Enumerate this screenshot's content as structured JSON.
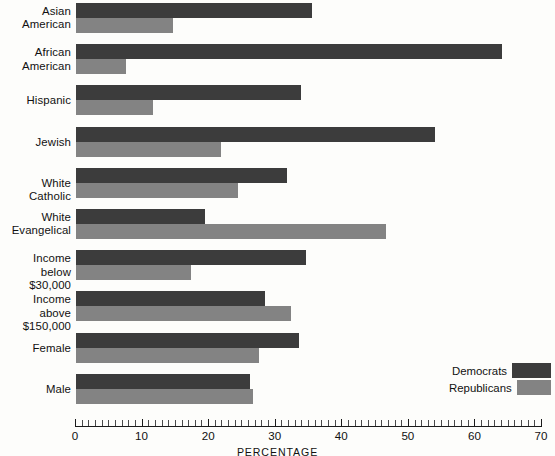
{
  "chart_data": {
    "type": "bar",
    "orientation": "horizontal",
    "title": "",
    "xlabel": "PERCENTAGE",
    "ylabel": "",
    "xlim": [
      0,
      70
    ],
    "xticks": [
      0,
      10,
      20,
      30,
      40,
      50,
      60,
      70
    ],
    "xtick_labels": [
      "0",
      "10",
      "20",
      "30",
      "40",
      "50",
      "60",
      "70"
    ],
    "minor_tick_step": 1,
    "grid": false,
    "legend_position": "bottom-right",
    "categories": [
      "Asian American",
      "African American",
      "Hispanic",
      "Jewish",
      "White Catholic",
      "White Evangelical",
      "Income below $30,000",
      "Income above $150,000",
      "Female",
      "Male"
    ],
    "category_lines": [
      [
        "Asian",
        "American"
      ],
      [
        "African",
        "American"
      ],
      [
        "Hispanic"
      ],
      [
        "Jewish"
      ],
      [
        "White Catholic"
      ],
      [
        "White",
        "Evangelical"
      ],
      [
        "Income below",
        "$30,000"
      ],
      [
        "Income above",
        "$150,000"
      ],
      [
        "Female"
      ],
      [
        "Male"
      ]
    ],
    "series": [
      {
        "name": "Democrats",
        "color": "#3c3c3c",
        "values": [
          35.5,
          64.0,
          33.8,
          54.0,
          31.7,
          19.4,
          34.5,
          28.4,
          33.5,
          26.1
        ]
      },
      {
        "name": "Republicans",
        "color": "#838383",
        "values": [
          14.5,
          7.5,
          11.5,
          21.8,
          24.3,
          46.5,
          17.3,
          32.3,
          27.5,
          26.6
        ]
      }
    ]
  },
  "legend": {
    "entries": [
      {
        "label": "Democrats",
        "color": "#3c3c3c"
      },
      {
        "label": "Republicans",
        "color": "#838383"
      }
    ]
  },
  "axis": {
    "title": "PERCENTAGE"
  }
}
